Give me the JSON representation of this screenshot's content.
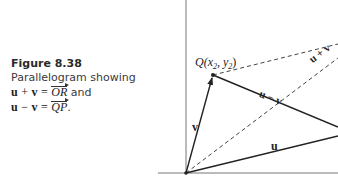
{
  "caption": {
    "figure_number": "Figure 8.38",
    "description": "Parallelogram showing",
    "line1": {
      "lhs_u": "u",
      "op": "+",
      "lhs_v": "v",
      "eq": "=",
      "vector": "OR",
      "suffix": "and"
    },
    "line2": {
      "lhs_u": "u",
      "op": "−",
      "lhs_v": "v",
      "eq": "=",
      "vector": "QP",
      "suffix": "."
    }
  },
  "diagram": {
    "point_labels": {
      "Q": "Q(x",
      "Q_sub1": "2",
      "Q_mid": ", y",
      "Q_sub2": "2",
      "Q_end": ")"
    },
    "vector_labels": {
      "v": "v",
      "u": "u",
      "u_minus_v": "u − v",
      "u_plus_v": "u + v"
    },
    "colors": {
      "axis": "#777777",
      "vector": "#222222",
      "dashed": "#444444"
    }
  }
}
